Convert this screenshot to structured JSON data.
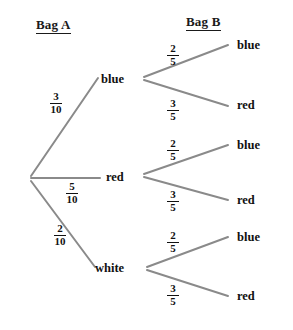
{
  "diagram": {
    "type": "probability-tree",
    "title": "",
    "headers": {
      "level1": "Bag A",
      "level2": "Bag B"
    },
    "colors": {
      "branch_line": "#8a8a8a",
      "text": "#111111"
    },
    "root": {
      "label": "",
      "x": 30,
      "y": 178
    },
    "level1_nodes": [
      {
        "id": "n-blue",
        "label": "blue",
        "probability": "3/10",
        "numerator": "3",
        "denominator": "10",
        "x": 105,
        "y": 80,
        "fraction_x": 46,
        "fraction_y": 97
      },
      {
        "id": "n-red",
        "label": "red",
        "probability": "5/10",
        "numerator": "5",
        "denominator": "10",
        "x": 110,
        "y": 178,
        "fraction_x": 62,
        "fraction_y": 186
      },
      {
        "id": "n-white",
        "label": "white",
        "probability": "2/10",
        "numerator": "2",
        "denominator": "10",
        "x": 99,
        "y": 270,
        "fraction_x": 50,
        "fraction_y": 228
      }
    ],
    "level2_branches": [
      {
        "parent": "blue",
        "leaf_label": "blue",
        "probability": "2/5",
        "numerator": "2",
        "denominator": "5",
        "leaf_x": 239,
        "leaf_y": 46,
        "fraction_x": 165,
        "fraction_y": 49
      },
      {
        "parent": "blue",
        "leaf_label": "red",
        "probability": "3/5",
        "numerator": "3",
        "denominator": "5",
        "leaf_x": 239,
        "leaf_y": 106,
        "fraction_x": 165,
        "fraction_y": 104
      },
      {
        "parent": "red",
        "leaf_label": "blue",
        "probability": "2/5",
        "numerator": "2",
        "denominator": "5",
        "leaf_x": 239,
        "leaf_y": 146,
        "fraction_x": 165,
        "fraction_y": 144
      },
      {
        "parent": "red",
        "leaf_label": "red",
        "probability": "3/5",
        "numerator": "3",
        "denominator": "5",
        "leaf_x": 239,
        "leaf_y": 201,
        "fraction_x": 165,
        "fraction_y": 194
      },
      {
        "parent": "white",
        "leaf_label": "blue",
        "probability": "2/5",
        "numerator": "2",
        "denominator": "5",
        "leaf_x": 239,
        "leaf_y": 238,
        "fraction_x": 165,
        "fraction_y": 236
      },
      {
        "parent": "white",
        "leaf_label": "red",
        "probability": "3/5",
        "numerator": "3",
        "denominator": "5",
        "leaf_x": 239,
        "leaf_y": 297,
        "fraction_x": 165,
        "fraction_y": 289
      }
    ]
  }
}
